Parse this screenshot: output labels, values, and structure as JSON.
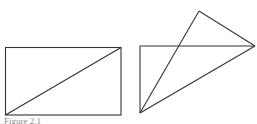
{
  "figure": {
    "caption": "Figure 2.1",
    "stroke_color": "#333333",
    "left_shape": {
      "description": "rectangle with diagonal",
      "rect": {
        "x": 5,
        "y": 47,
        "w": 116,
        "h": 68
      },
      "diagonal": {
        "x1": 5,
        "y1": 115,
        "x2": 121,
        "y2": 47
      }
    },
    "right_shape": {
      "description": "folded rectangle / triangle",
      "points": {
        "top_left": [
          140,
          46
        ],
        "bottom_left": [
          140,
          113
        ],
        "right": [
          255,
          46
        ],
        "apex": [
          199,
          11
        ]
      }
    }
  }
}
